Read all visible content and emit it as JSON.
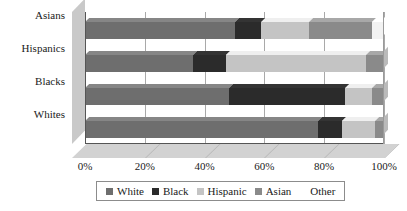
{
  "chart_data": {
    "type": "bar",
    "orientation": "horizontal",
    "stacked": true,
    "percent": true,
    "three_d": true,
    "title": "",
    "subtitle": "",
    "xlabel": "",
    "ylabel": "",
    "xlim": [
      0,
      100
    ],
    "grid": true,
    "legend_position": "bottom",
    "categories": [
      "Whites",
      "Blacks",
      "Hispanics",
      "Asians"
    ],
    "tick_labels": [
      "0%",
      "20%",
      "40%",
      "60%",
      "80%",
      "100%"
    ],
    "tick_values": [
      0,
      20,
      40,
      60,
      80,
      100
    ],
    "series": [
      {
        "name": "White",
        "color": "#6e6e6e",
        "values": [
          78,
          48,
          36,
          50
        ]
      },
      {
        "name": "Black",
        "color": "#2b2b2b",
        "values": [
          8,
          39,
          11,
          9
        ]
      },
      {
        "name": "Hispanic",
        "color": "#c4c4c4",
        "values": [
          11,
          9,
          47,
          16
        ]
      },
      {
        "name": "Asian",
        "color": "#8a8a8a",
        "values": [
          3,
          4,
          6,
          21
        ]
      },
      {
        "name": "Other",
        "color": "#f2f2f2",
        "values": [
          0,
          0,
          0,
          4
        ]
      }
    ]
  },
  "legend": {
    "items": [
      {
        "label": "White",
        "color": "#6e6e6e"
      },
      {
        "label": "Black",
        "color": "#2b2b2b"
      },
      {
        "label": "Hispanic",
        "color": "#c4c4c4"
      },
      {
        "label": "Asian",
        "color": "#8a8a8a"
      },
      {
        "label": "Other",
        "color": "#f2f2f2"
      }
    ]
  }
}
